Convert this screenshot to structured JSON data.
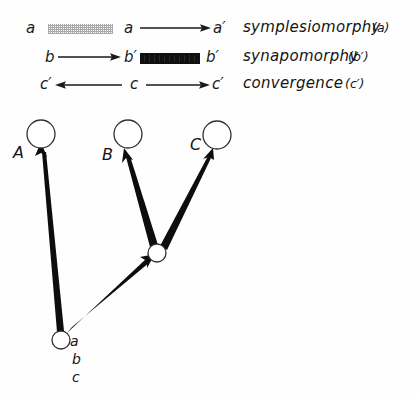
{
  "figure": {
    "type": "cladogram-character-transformation-diagram",
    "background": "#fefefe",
    "ink": "#141414"
  },
  "legend": {
    "rows": [
      {
        "id": "symplesiomorphy",
        "start_state": "a",
        "bar_style": "stippled",
        "mid_state": "a",
        "arrow": "right",
        "end_state": "a′",
        "term": "symplesiomorphy",
        "term_paren": "(a)"
      },
      {
        "id": "synapomorphy",
        "start_state": "b",
        "arrow": "right",
        "mid_state": "b′",
        "bar_style": "solid",
        "end_state": "b′",
        "term": "synapomorphy",
        "term_paren": "(b′)"
      },
      {
        "id": "convergence",
        "start_state": "c′",
        "arrow_left": "left",
        "mid_state": "c",
        "arrow": "right",
        "end_state": "c′",
        "term": "convergence",
        "term_paren": "(c′)"
      }
    ]
  },
  "tree": {
    "terminals": [
      {
        "id": "A",
        "label": "A"
      },
      {
        "id": "B",
        "label": "B"
      },
      {
        "id": "C",
        "label": "C"
      }
    ],
    "internal_nodes": [
      {
        "id": "bc-ancestor"
      },
      {
        "id": "root"
      }
    ],
    "root_states": [
      "a",
      "b",
      "c"
    ],
    "branches": [
      {
        "from": "root",
        "to": "A",
        "style": "tapered-arrow"
      },
      {
        "from": "root",
        "to": "bc-ancestor",
        "style": "tapered-arrow"
      },
      {
        "from": "bc-ancestor",
        "to": "B",
        "style": "tapered-arrow"
      },
      {
        "from": "bc-ancestor",
        "to": "C",
        "style": "tapered-arrow"
      }
    ]
  }
}
